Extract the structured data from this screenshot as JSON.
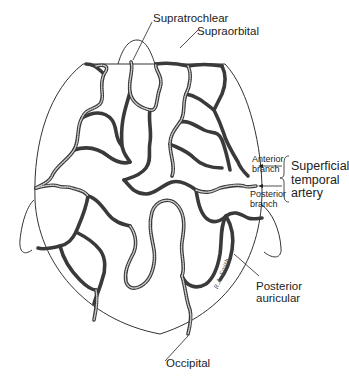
{
  "diagram": {
    "labels": {
      "supratrochlear": "Supratrochlear",
      "supraorbital": "Supraorbital",
      "anterior_branch": [
        "Anterior",
        "branch"
      ],
      "posterior_branch": [
        "Posterior",
        "branch"
      ],
      "superficial_temporal_artery": [
        "Superficial",
        "temporal",
        "artery"
      ],
      "posterior_auricular": [
        "Posterior",
        "auricular"
      ],
      "occipital": "Occipital"
    },
    "signature": "R.A. Smith",
    "colors": {
      "background": "#ffffff",
      "vessel": "#3a3a3a",
      "outline": "#333333",
      "text": "#222222"
    }
  }
}
